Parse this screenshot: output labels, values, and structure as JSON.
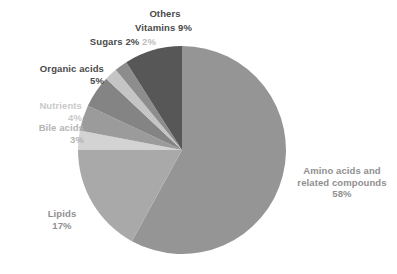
{
  "chart_data": {
    "type": "pie",
    "title": "",
    "subtitle": "",
    "xlabel": "",
    "ylabel": "",
    "legend_position": "none",
    "grid": false,
    "label_format": "name + percent",
    "start_angle_deg": 0,
    "direction": "clockwise",
    "center": {
      "cx": 182,
      "cy": 150,
      "r": 104
    },
    "categories": [
      "Amino acids and related compounds",
      "Lipids",
      "Bile acids",
      "Nutrients",
      "Organic acids",
      "Sugars",
      "Vitamins",
      "Others"
    ],
    "values": [
      58,
      17,
      3,
      4,
      5,
      2,
      2,
      9
    ],
    "units": "%",
    "slices": [
      {
        "name": "Amino acids and related compounds",
        "label_line1": "Amino acids and",
        "label_line2": "related compounds",
        "percent": 58,
        "percent_text": "58%",
        "color": "#959595",
        "start_deg": 0,
        "sweep_deg": 208.8
      },
      {
        "name": "Lipids",
        "label_line1": "Lipids",
        "label_line2": "",
        "percent": 17,
        "percent_text": "17%",
        "color": "#a9a9a9",
        "start_deg": 208.8,
        "sweep_deg": 61.2
      },
      {
        "name": "Bile acids",
        "label_line1": "Bile acids",
        "label_line2": "",
        "percent": 3,
        "percent_text": "3%",
        "color": "#d3d3d3",
        "start_deg": 270.0,
        "sweep_deg": 10.8
      },
      {
        "name": "Nutrients",
        "label_line1": "Nutrients",
        "label_line2": "",
        "percent": 4,
        "percent_text": "4%",
        "color": "#9b9b9b",
        "start_deg": 280.8,
        "sweep_deg": 14.4
      },
      {
        "name": "Organic acids",
        "label_line1": "Organic acids",
        "label_line2": "",
        "percent": 5,
        "percent_text": "5%",
        "color": "#848484",
        "start_deg": 295.2,
        "sweep_deg": 18.0
      },
      {
        "name": "Sugars",
        "label_line1": "Sugars",
        "label_line2": "",
        "percent": 2,
        "percent_text": "2%",
        "color": "#c5c5c5",
        "start_deg": 313.2,
        "sweep_deg": 7.2
      },
      {
        "name": "Vitamins",
        "label_line1": "Vitamins",
        "label_line2": "",
        "percent": 2,
        "percent_text": "2%",
        "color": "#8d8d8d",
        "start_deg": 320.4,
        "sweep_deg": 7.2
      },
      {
        "name": "Others",
        "label_line1": "Others",
        "label_line2": "",
        "percent": 9,
        "percent_text": "9%",
        "color": "#575757",
        "start_deg": 327.6,
        "sweep_deg": 32.4
      }
    ],
    "colors": {
      "background": "#ffffff",
      "amino": "#959595",
      "lipids": "#a9a9a9",
      "bile_acids": "#d3d3d3",
      "nutrients": "#9b9b9b",
      "organic_acids": "#848484",
      "sugars": "#c5c5c5",
      "vitamins": "#8d8d8d",
      "others": "#575757",
      "label_dark": "#4a4a4a",
      "label_mid": "#8f8f8f",
      "label_light": "#c9c9c9"
    }
  }
}
